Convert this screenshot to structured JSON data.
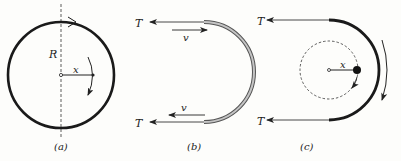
{
  "figure": {
    "panels": [
      {
        "id": "a",
        "caption": "(a)",
        "labels": {
          "radius": "R",
          "distance": "x"
        },
        "description": "Full circular loop of rope with vertical dashed axis, radius x to a point, rotation arrows"
      },
      {
        "id": "b",
        "caption": "(b)",
        "labels": {
          "tension_top": "T",
          "tension_bottom": "T",
          "velocity_top": "v",
          "velocity_bottom": "v"
        },
        "description": "Rope moving around a semicircular guide with tension T at both ends and velocity v"
      },
      {
        "id": "c",
        "caption": "(c)",
        "labels": {
          "tension_top": "T",
          "tension_bottom": "T",
          "distance": "x"
        },
        "description": "Thick semicircular rope segment with dashed circle, point mass at distance x, rotation arrows"
      }
    ],
    "colors": {
      "stroke": "#1a1a1a",
      "thin": "#444444",
      "rope_fill": "#bdbdbd"
    }
  }
}
